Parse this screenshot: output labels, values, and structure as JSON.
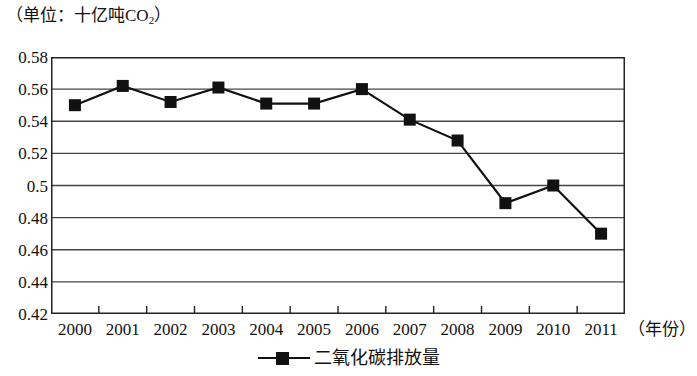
{
  "chart_data": {
    "type": "line",
    "unit_prefix": "（单位：十亿吨CO",
    "unit_sub": "2",
    "unit_suffix": "）",
    "xlabel": "（年份）",
    "ylabel": "",
    "categories": [
      "2000",
      "2001",
      "2002",
      "2003",
      "2004",
      "2005",
      "2006",
      "2007",
      "2008",
      "2009",
      "2010",
      "2011"
    ],
    "series": [
      {
        "name": "二氧化碳排放量",
        "values": [
          0.55,
          0.562,
          0.552,
          0.561,
          0.551,
          0.551,
          0.56,
          0.541,
          0.528,
          0.489,
          0.5,
          0.47
        ],
        "marker": "square",
        "color": "#111111"
      }
    ],
    "ylim": [
      0.42,
      0.58
    ],
    "ytick_step": 0.02,
    "yticks": [
      "0.58",
      "0.56",
      "0.54",
      "0.52",
      "0.5",
      "0.48",
      "0.46",
      "0.44",
      "0.42"
    ],
    "ytick_values": [
      0.58,
      0.56,
      0.54,
      0.52,
      0.5,
      0.48,
      0.46,
      0.44,
      0.42
    ],
    "grid": true,
    "grid_axis": "y",
    "legend_position": "bottom",
    "line_color": "#111111",
    "grid_color": "#444444",
    "axis_color": "#222222",
    "background": "#ffffff"
  },
  "legend": {
    "items": [
      {
        "label": "二氧化碳排放量"
      }
    ]
  }
}
